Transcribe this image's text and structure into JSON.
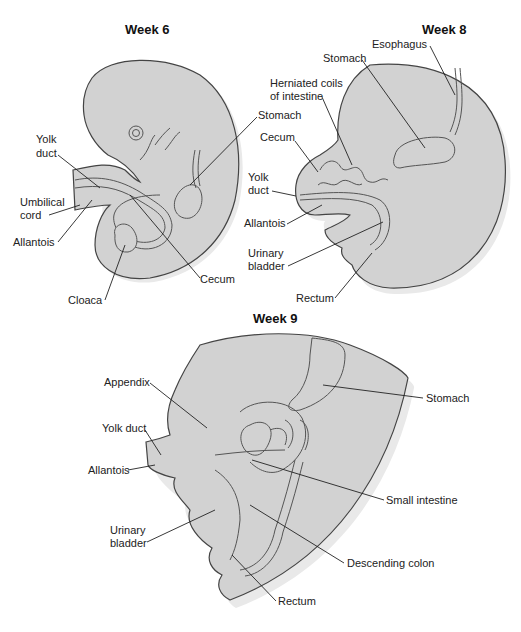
{
  "panels": [
    {
      "title": "Week 6",
      "labels": [
        "Yolk duct",
        "Umbilical cord",
        "Allantois",
        "Cloaca",
        "Cecum",
        "Stomach"
      ]
    },
    {
      "title": "Week 8",
      "labels": [
        "Esophagus",
        "Stomach",
        "Herniated coils of intestine",
        "Cecum",
        "Yolk duct",
        "Allantois",
        "Urinary bladder",
        "Rectum"
      ]
    },
    {
      "title": "Week 9",
      "labels": [
        "Appendix",
        "Yolk duct",
        "Allantois",
        "Urinary bladder",
        "Stomach",
        "Small intestine",
        "Descending colon",
        "Rectum"
      ]
    }
  ],
  "w6": {
    "title": "Week 6",
    "yolk1": "Yolk",
    "yolk2": "duct",
    "umb1": "Umbilical",
    "umb2": "cord",
    "allantois": "Allantois",
    "cloaca": "Cloaca",
    "cecum": "Cecum",
    "stomach": "Stomach"
  },
  "w8": {
    "title": "Week 8",
    "esophagus": "Esophagus",
    "stomach": "Stomach",
    "herniated1": "Herniated coils",
    "herniated2": "of intestine",
    "cecum": "Cecum",
    "yolk1": "Yolk",
    "yolk2": "duct",
    "allantois": "Allantois",
    "urinary1": "Urinary",
    "urinary2": "bladder",
    "rectum": "Rectum"
  },
  "w9": {
    "title": "Week 9",
    "appendix": "Appendix",
    "yolk": "Yolk duct",
    "allantois": "Allantois",
    "urinary1": "Urinary",
    "urinary2": "bladder",
    "stomach": "Stomach",
    "small": "Small intestine",
    "descending": "Descending colon",
    "rectum": "Rectum"
  }
}
